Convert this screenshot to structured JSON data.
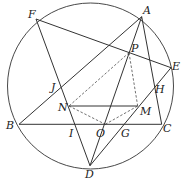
{
  "diagram": {
    "type": "geometry-figure",
    "stroke_color": "#333333",
    "circle": {
      "cx": 90.5,
      "cy": 86,
      "r": 83
    },
    "points": {
      "A": {
        "x": 141.7,
        "y": 16.7,
        "label": "A",
        "lx": 143,
        "ly": 14
      },
      "B": {
        "x": 19,
        "y": 124.3,
        "label": "B",
        "lx": 6,
        "ly": 129
      },
      "C": {
        "x": 161.7,
        "y": 124.3,
        "label": "C",
        "lx": 163,
        "ly": 132
      },
      "D": {
        "x": 90,
        "y": 165.7,
        "label": "D",
        "lx": 85,
        "ly": 178
      },
      "E": {
        "x": 171,
        "y": 67.7,
        "label": "E",
        "lx": 172,
        "ly": 70
      },
      "F": {
        "x": 36,
        "y": 19,
        "label": "F",
        "lx": 28,
        "ly": 18
      },
      "P": {
        "x": 129,
        "y": 52.7,
        "label": "P",
        "lx": 131,
        "ly": 52
      },
      "N": {
        "x": 69,
        "y": 106,
        "label": "N",
        "lx": 58,
        "ly": 111
      },
      "M": {
        "x": 137.7,
        "y": 106,
        "label": "M",
        "lx": 140,
        "ly": 115
      },
      "O": {
        "x": 105.3,
        "y": 124.3,
        "label": "O",
        "lx": 96,
        "ly": 137
      },
      "G": {
        "x": 122.7,
        "y": 124.3,
        "label": "G",
        "lx": 121,
        "ly": 137
      },
      "I": {
        "x": 75.7,
        "y": 124.3,
        "label": "I",
        "lx": 69,
        "ly": 137
      },
      "J": {
        "x": 59.3,
        "y": 87.3,
        "label": "J",
        "lx": 51,
        "ly": 91
      },
      "H": {
        "x": 155,
        "y": 82.7,
        "label": "H",
        "lx": 155,
        "ly": 93
      }
    },
    "solid_segments": [
      [
        "A",
        "B"
      ],
      [
        "A",
        "C"
      ],
      [
        "A",
        "D"
      ],
      [
        "B",
        "C"
      ],
      [
        "F",
        "E"
      ],
      [
        "F",
        "D"
      ],
      [
        "D",
        "E"
      ],
      [
        "N",
        "M"
      ]
    ],
    "dashed_segments": [
      [
        "P",
        "N"
      ],
      [
        "P",
        "M"
      ],
      [
        "N",
        "O"
      ],
      [
        "O",
        "M"
      ]
    ]
  }
}
